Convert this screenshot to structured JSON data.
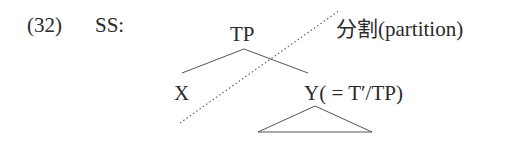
{
  "example": {
    "number": "(32)",
    "label": "SS:"
  },
  "tree": {
    "root": "TP",
    "left_node": "X",
    "right_node": "Y",
    "right_node_gloss": "( = T′/TP)",
    "partition_label": "分割(partition)"
  },
  "colors": {
    "text": "#2a2a2a",
    "lines": "#555555"
  }
}
